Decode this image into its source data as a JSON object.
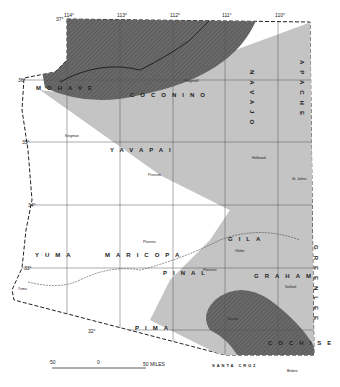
{
  "map": {
    "region": "Arizona",
    "colors": {
      "background": "#ffffff",
      "zone_light": "#c4c4c4",
      "zone_dark": "#6a6a6a",
      "border": "#222222",
      "grid": "#555555"
    },
    "longitude_labels": [
      "114°",
      "113°",
      "112°",
      "111°",
      "110°"
    ],
    "latitude_labels": [
      "37°",
      "36°",
      "35°",
      "34°",
      "33°",
      "32°"
    ],
    "counties": [
      "MOHAVE",
      "COCONINO",
      "NAVAJO",
      "APACHE",
      "YAVAPAI",
      "YUMA",
      "MARICOPA",
      "GILA",
      "PINAL",
      "GRAHAM",
      "GREENLEE",
      "PIMA",
      "SANTA CRUZ",
      "COCHISE"
    ],
    "rivers": [
      "GILA RIVER",
      "COLORADO RIVER"
    ],
    "towns": [
      "Kingman",
      "Flagstaff",
      "Prescott",
      "Holbrook",
      "St. Johns",
      "Phoenix",
      "Globe",
      "Florence",
      "Safford",
      "Tucson",
      "Bisbee",
      "Yuma"
    ],
    "scale": {
      "left": "50",
      "mid": "0",
      "right": "50 MILES"
    }
  }
}
